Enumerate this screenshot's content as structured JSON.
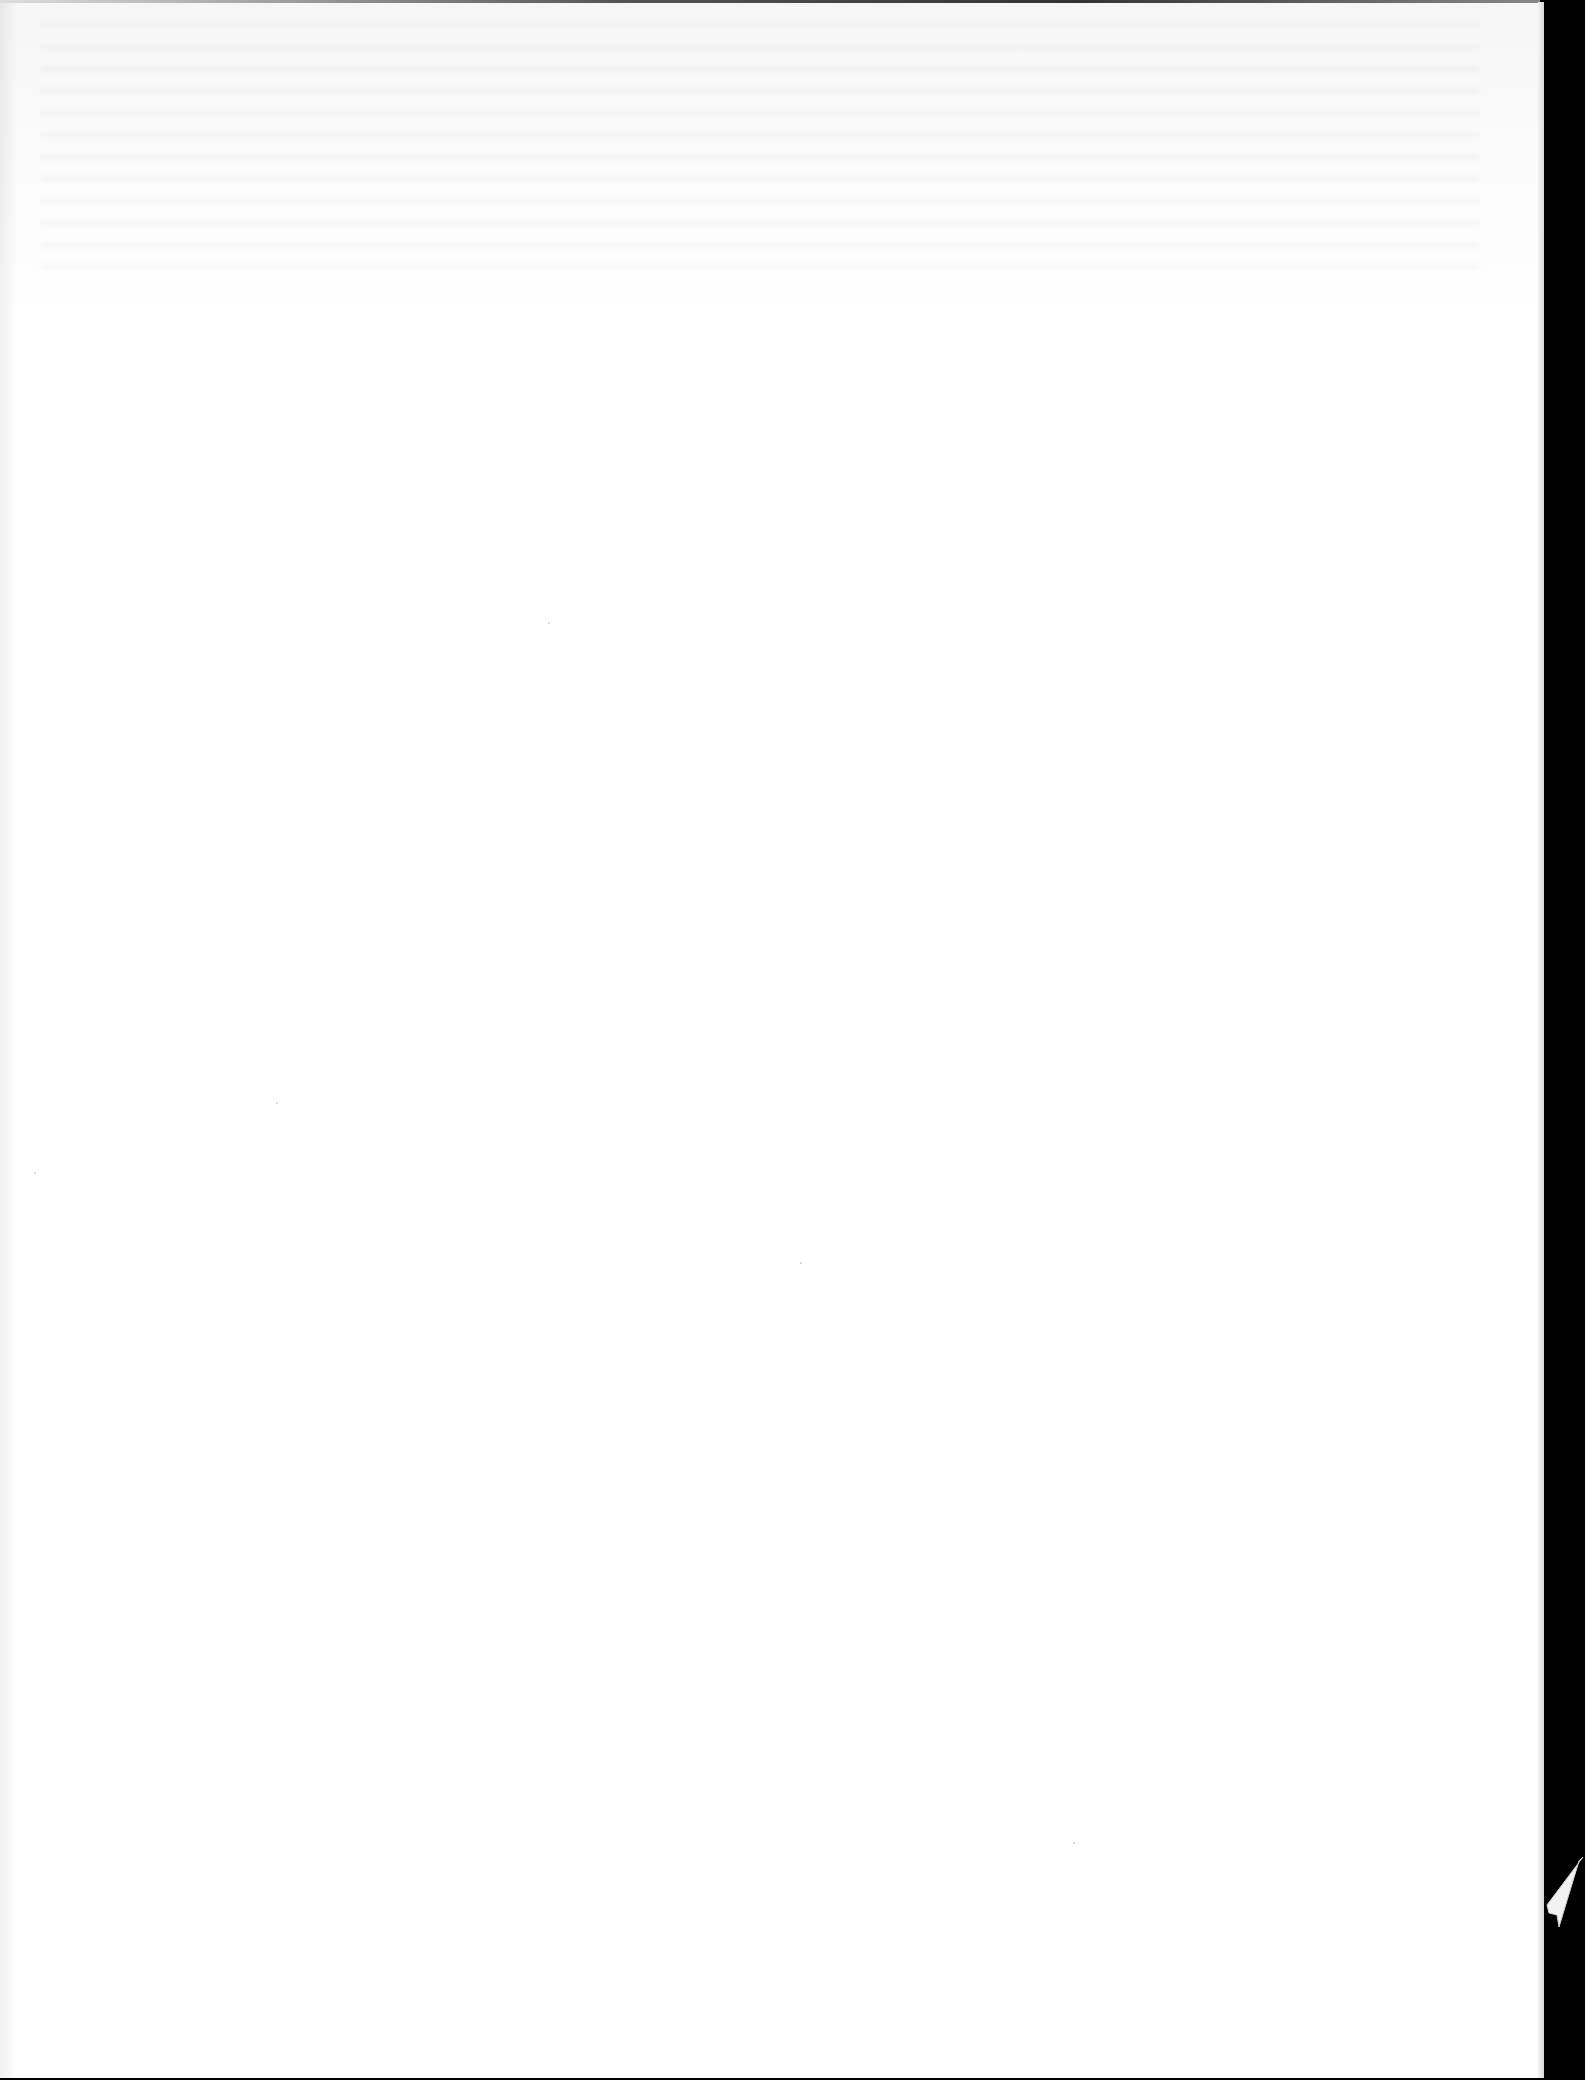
{
  "document": {
    "type": "scanned-page",
    "state": "blank",
    "text": "",
    "colors": {
      "paper": "#ffffff",
      "scan_background": "#000000"
    },
    "features": [
      "show-through-faint-top",
      "right-edge-tear-bottom"
    ]
  }
}
